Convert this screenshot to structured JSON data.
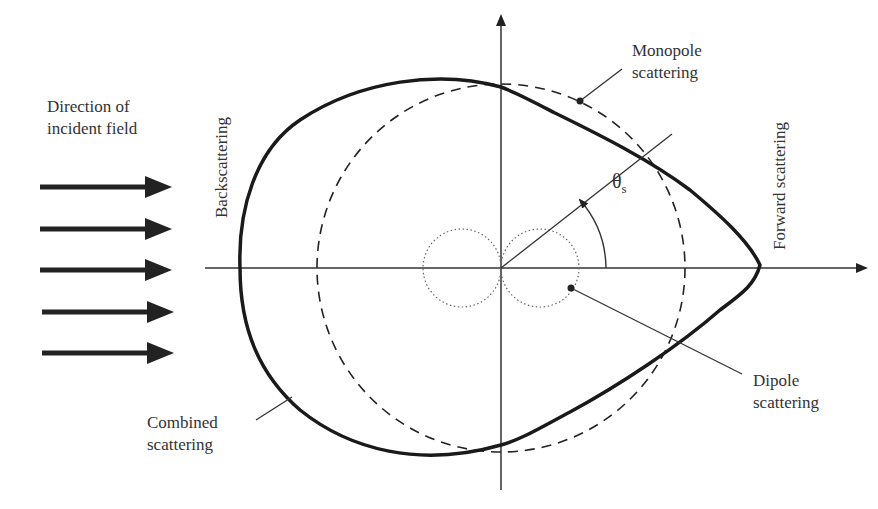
{
  "diagram": {
    "labels": {
      "incident_line1": "Direction of",
      "incident_line2": "incident field",
      "backscattering": "Backscattering",
      "forward_scattering": "Forward scattering",
      "monopole_line1": "Monopole",
      "monopole_line2": "scattering",
      "dipole_line1": "Dipole",
      "dipole_line2": "scattering",
      "combined_line1": "Combined",
      "combined_line2": "scattering",
      "angle": "θ",
      "angle_subscript": "s"
    },
    "elements": {
      "incident_arrows": 5,
      "monopole": "dashed circle centered at origin",
      "dipole": "two dotted circles (figure-eight) touching at origin",
      "combined": "thick solid cardioid-like curve, maximum in forward direction"
    },
    "colors": {
      "ink": "#222222",
      "text": "#333333",
      "background": "#ffffff"
    }
  }
}
